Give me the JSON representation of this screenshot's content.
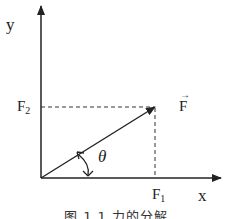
{
  "diagram": {
    "axes": {
      "x_label": "x",
      "y_label": "y"
    },
    "components": {
      "f1_label": "F",
      "f1_sub": "1",
      "f2_label": "F",
      "f2_sub": "2"
    },
    "vector": {
      "label": "F",
      "arrow_mark": "→"
    },
    "angle": {
      "label": "θ"
    },
    "caption": "图 1.1   力的分解"
  }
}
